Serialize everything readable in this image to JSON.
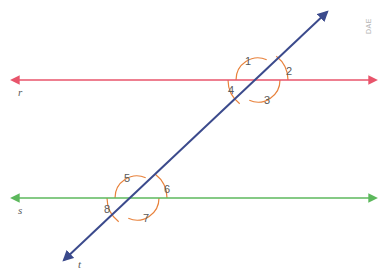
{
  "canvas": {
    "width": 387,
    "height": 278,
    "background": "#ffffff"
  },
  "colors": {
    "line_r": "#e8546b",
    "line_s": "#5cb85c",
    "line_t": "#3b4a8c",
    "arc": "#e8823c",
    "label": "#5a5a5a",
    "watermark": "#b4b4b4"
  },
  "watermark": {
    "text": "DAE",
    "x": 371,
    "y": 34,
    "rotation": -90
  },
  "lines": [
    {
      "id": "line-r",
      "name": "r",
      "label": "r",
      "color": "#e8546b",
      "type": "double-arrow-horizontal",
      "x1": 12,
      "y1": 80,
      "x2": 376,
      "y2": 80,
      "label_x": 18,
      "label_y": 96
    },
    {
      "id": "line-s",
      "name": "s",
      "label": "s",
      "color": "#5cb85c",
      "type": "double-arrow-horizontal",
      "x1": 12,
      "y1": 198,
      "x2": 376,
      "y2": 198,
      "label_x": 18,
      "label_y": 214
    },
    {
      "id": "line-t",
      "name": "t",
      "label": "t",
      "color": "#3b4a8c",
      "type": "double-arrow-transversal",
      "x1": 64,
      "y1": 260,
      "x2": 327,
      "y2": 12,
      "label_x": 78,
      "label_y": 268
    }
  ],
  "intersections": [
    {
      "id": "upper",
      "on_line": "r",
      "x": 258,
      "y": 80
    },
    {
      "id": "lower",
      "on_line": "s",
      "x": 137,
      "y": 198
    }
  ],
  "angles": [
    {
      "number": "1",
      "intersection": "upper",
      "position": "top-left",
      "label_x": 245,
      "label_y": 65,
      "arc_type": "large"
    },
    {
      "number": "2",
      "intersection": "upper",
      "position": "top-right",
      "label_x": 286,
      "label_y": 75,
      "arc_type": "small"
    },
    {
      "number": "3",
      "intersection": "upper",
      "position": "bottom-right",
      "label_x": 264,
      "label_y": 104,
      "arc_type": "large"
    },
    {
      "number": "4",
      "intersection": "upper",
      "position": "bottom-left",
      "label_x": 228,
      "label_y": 94,
      "arc_type": "small"
    },
    {
      "number": "5",
      "intersection": "lower",
      "position": "top-left",
      "label_x": 124,
      "label_y": 182,
      "arc_type": "large"
    },
    {
      "number": "6",
      "intersection": "lower",
      "position": "top-right",
      "label_x": 164,
      "label_y": 193,
      "arc_type": "small"
    },
    {
      "number": "7",
      "intersection": "lower",
      "position": "bottom-right",
      "label_x": 143,
      "label_y": 222,
      "arc_type": "large"
    },
    {
      "number": "8",
      "intersection": "lower",
      "position": "bottom-left",
      "label_x": 104,
      "label_y": 213,
      "arc_type": "small"
    }
  ]
}
